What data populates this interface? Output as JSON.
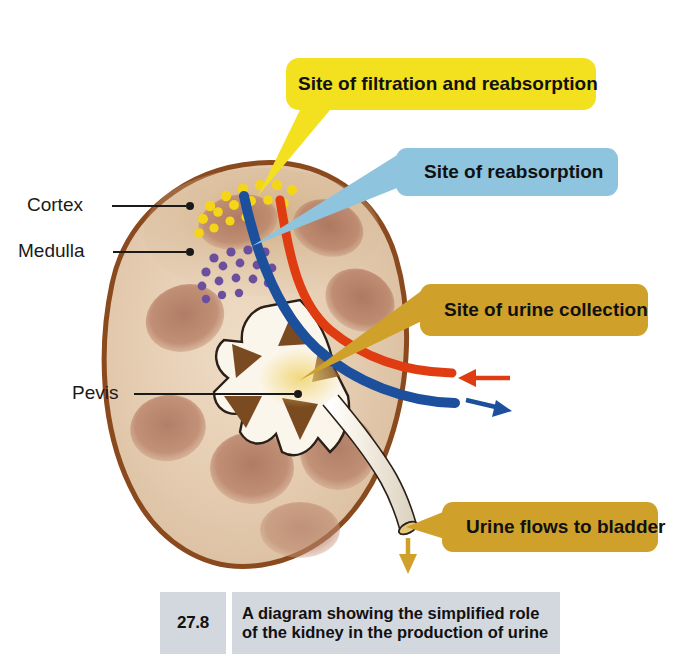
{
  "figure": {
    "background_color": "#ffffff",
    "title_number": "27.8",
    "caption": "A diagram showing the simplified role of the kidney in the production of urine"
  },
  "callouts": [
    {
      "id": "filtration",
      "label": "Site of filtration and reabsorption",
      "color": "#f3e01e",
      "text_color": "#111111",
      "points_to": "renal-cortex"
    },
    {
      "id": "reabsorption",
      "label": "Site of reabsorption",
      "color": "#8ec4dd",
      "text_color": "#111111",
      "points_to": "renal-medulla"
    },
    {
      "id": "urine-collection",
      "label": "Site of urine collection",
      "color": "#cfa12b",
      "text_color": "#111111",
      "points_to": "renal-pelvis"
    },
    {
      "id": "urine-flow",
      "label": "Urine flows to bladder",
      "color": "#cfa12b",
      "text_color": "#111111",
      "points_to": "ureter"
    }
  ],
  "annotations": [
    {
      "id": "cortex",
      "label": "Cortex"
    },
    {
      "id": "medulla",
      "label": "Medulla"
    },
    {
      "id": "pelvis",
      "label": "Pevis"
    }
  ],
  "anatomy": {
    "kidney_outline_color": "#8a4a1e",
    "kidney_body_color": "#e6cdb2",
    "cortex_color": "#d9c0a2",
    "pyramid_color": "#b07a5e",
    "medulla_dark_color": "#7a4a20",
    "pelvis_color": "#fbf6ec",
    "artery_color": "#e03c12",
    "vein_color": "#1c4f9c",
    "glomeruli_dot_color": "#f5d518",
    "nephron_loop_dot_color": "#6b4f9e",
    "ureter_color": "#f2ece0",
    "urine_arrow_color": "#cfa12b"
  },
  "flow_arrows": [
    {
      "id": "artery-inflow",
      "color": "#e03c12",
      "direction": "left"
    },
    {
      "id": "vein-outflow",
      "color": "#1c4f9c",
      "direction": "right"
    },
    {
      "id": "urine-outflow",
      "color": "#cfa12b",
      "direction": "down"
    }
  ]
}
